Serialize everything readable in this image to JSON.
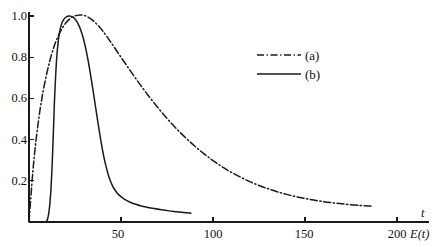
{
  "chart_data": {
    "type": "line",
    "title": "",
    "subtitle": "",
    "xlabel": "t",
    "ylabel": "",
    "corner_label": "E(t)",
    "xlim": [
      0,
      210
    ],
    "ylim": [
      0,
      1.06
    ],
    "grid": false,
    "legend_position": "upper-right-inside",
    "xticks": [
      50,
      100,
      150,
      200
    ],
    "xtick_labels": [
      "50",
      "100",
      "150",
      "200"
    ],
    "yticks": [
      0.2,
      0.4,
      0.6,
      0.8,
      1.0
    ],
    "ytick_labels": [
      "0.2",
      "0.4",
      "0.6",
      "0.8",
      "1.0"
    ],
    "series": [
      {
        "name": "(a)",
        "style": "dash-dot",
        "color": "#1a1a1a",
        "x": [
          0,
          1,
          2,
          3,
          4,
          5,
          6,
          7,
          8,
          10,
          12,
          14,
          16,
          18,
          20,
          22,
          24,
          26,
          28,
          30,
          33,
          36,
          40,
          45,
          50,
          55,
          60,
          65,
          70,
          75,
          80,
          85,
          90,
          95,
          100,
          105,
          110,
          120,
          130,
          140,
          150,
          160,
          170,
          180,
          186
        ],
        "y": [
          0.0,
          0.12,
          0.235,
          0.33,
          0.41,
          0.48,
          0.545,
          0.6,
          0.65,
          0.735,
          0.805,
          0.862,
          0.905,
          0.94,
          0.966,
          0.985,
          0.997,
          1.003,
          1.005,
          1.003,
          0.99,
          0.968,
          0.928,
          0.866,
          0.8,
          0.735,
          0.672,
          0.612,
          0.556,
          0.503,
          0.454,
          0.41,
          0.369,
          0.332,
          0.298,
          0.268,
          0.241,
          0.196,
          0.161,
          0.134,
          0.114,
          0.099,
          0.088,
          0.08,
          0.077
        ]
      },
      {
        "name": "(b)",
        "style": "solid",
        "color": "#1a1a1a",
        "x": [
          9.5,
          10,
          10.5,
          11,
          11.5,
          12,
          12.5,
          13,
          13.5,
          14,
          15,
          16,
          17,
          18,
          19,
          20,
          21,
          22,
          23,
          24,
          25,
          26,
          27,
          28,
          29,
          30,
          31,
          32,
          33,
          34,
          35,
          36,
          37,
          38,
          39,
          40,
          41,
          42,
          43,
          44,
          45,
          46,
          48,
          50,
          52,
          55,
          58,
          61,
          64,
          68,
          72,
          76,
          80,
          84,
          88
        ],
        "y": [
          0.0,
          0.012,
          0.03,
          0.06,
          0.105,
          0.17,
          0.26,
          0.375,
          0.5,
          0.62,
          0.79,
          0.885,
          0.938,
          0.968,
          0.985,
          0.994,
          0.999,
          1.0,
          0.998,
          0.993,
          0.985,
          0.973,
          0.956,
          0.935,
          0.908,
          0.875,
          0.836,
          0.79,
          0.74,
          0.685,
          0.628,
          0.568,
          0.51,
          0.452,
          0.398,
          0.348,
          0.303,
          0.265,
          0.232,
          0.205,
          0.183,
          0.165,
          0.14,
          0.123,
          0.11,
          0.096,
          0.086,
          0.078,
          0.072,
          0.065,
          0.059,
          0.054,
          0.05,
          0.046,
          0.043
        ]
      }
    ]
  },
  "legend": {
    "items": [
      {
        "label": "(a)",
        "style": "dash-dot"
      },
      {
        "label": "(b)",
        "style": "solid"
      }
    ]
  },
  "axes": {
    "x_axis_title": "t",
    "corner_title": "E(t)"
  }
}
